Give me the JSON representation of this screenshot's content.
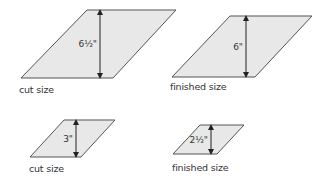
{
  "colors": {
    "fill": "#e8e8e8",
    "stroke": "#555555",
    "arrow": "#222222",
    "text": "#333333"
  },
  "panels": [
    {
      "id": "large-cut",
      "caption": "cut size",
      "dimension": "6½\"",
      "shape": {
        "top": [
          87,
          10,
          176,
          10
        ],
        "bottom": [
          21,
          78,
          113,
          78
        ]
      },
      "arrow_x": 100
    },
    {
      "id": "large-finished",
      "caption": "finished size",
      "dimension": "6\"",
      "shape": {
        "top": [
          230,
          16,
          312,
          16
        ],
        "bottom": [
          172,
          77,
          255,
          77
        ]
      },
      "arrow_x": 246
    },
    {
      "id": "small-cut",
      "caption": "cut size",
      "dimension": "3\"",
      "shape": {
        "top": [
          64,
          120,
          115,
          120
        ],
        "bottom": [
          30,
          157,
          81,
          157
        ]
      },
      "arrow_x": 76
    },
    {
      "id": "small-finished",
      "caption": "finished size",
      "dimension": "2½\"",
      "shape": {
        "top": [
          200,
          125,
          244,
          125
        ],
        "bottom": [
          173,
          154,
          217,
          154
        ]
      },
      "arrow_x": 211
    }
  ]
}
